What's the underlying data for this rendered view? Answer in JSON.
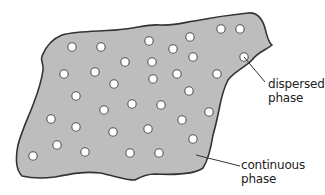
{
  "diagram": {
    "colors": {
      "continuous_fill": "#bdbdbd",
      "outline": "#333333",
      "particle_fill": "#ffffff",
      "particle_stroke": "#555555",
      "leader_line": "#333333",
      "text": "#222222"
    },
    "labels": {
      "dispersed": {
        "line1": "dispersed",
        "line2": "phase"
      },
      "continuous": {
        "line1": "continuous",
        "line2": "phase"
      }
    },
    "particles": [
      [
        72,
        47
      ],
      [
        101,
        47
      ],
      [
        149,
        41
      ],
      [
        190,
        37
      ],
      [
        221,
        29
      ],
      [
        240,
        29
      ],
      [
        64,
        74
      ],
      [
        95,
        72
      ],
      [
        125,
        62
      ],
      [
        152,
        62
      ],
      [
        173,
        49
      ],
      [
        193,
        57
      ],
      [
        244,
        57
      ],
      [
        114,
        84
      ],
      [
        177,
        74
      ],
      [
        217,
        74
      ],
      [
        76,
        96
      ],
      [
        153,
        79
      ],
      [
        189,
        91
      ],
      [
        51,
        119
      ],
      [
        104,
        110
      ],
      [
        132,
        104
      ],
      [
        161,
        105
      ],
      [
        209,
        112
      ],
      [
        76,
        127
      ],
      [
        148,
        129
      ],
      [
        182,
        120
      ],
      [
        57,
        145
      ],
      [
        113,
        132
      ],
      [
        193,
        139
      ],
      [
        33,
        156
      ],
      [
        85,
        152
      ],
      [
        130,
        153
      ],
      [
        159,
        153
      ]
    ]
  }
}
